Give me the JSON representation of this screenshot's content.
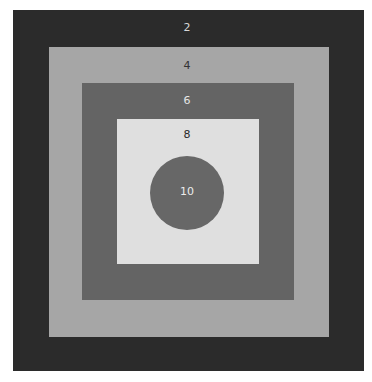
{
  "diagram": {
    "title": "",
    "rings": [
      {
        "label": "2",
        "color": "#2b2b2b",
        "text_color": "#d8d8d8",
        "x": 13,
        "y": 10,
        "w": 351,
        "h": 361
      },
      {
        "label": "4",
        "color": "#a6a6a6",
        "text_color": "#333333",
        "x": 49,
        "y": 47,
        "w": 280,
        "h": 290
      },
      {
        "label": "6",
        "color": "#646464",
        "text_color": "#e6e6e6",
        "x": 82,
        "y": 83,
        "w": 212,
        "h": 217
      },
      {
        "label": "8",
        "color": "#dfdfdf",
        "text_color": "#2a2a2a",
        "x": 117,
        "y": 119,
        "w": 142,
        "h": 145
      }
    ],
    "center": {
      "label": "10",
      "color": "#676767",
      "text_color": "#ececec",
      "cx": 187,
      "cy": 193,
      "r": 37
    }
  }
}
